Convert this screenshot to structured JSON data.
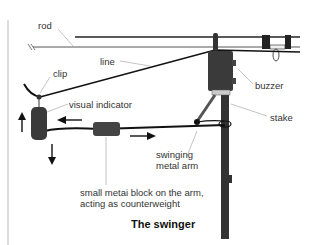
{
  "title": "The swinger",
  "labels": {
    "rod": "rod",
    "line": "line",
    "clip": "clip",
    "visual_indicator": "visual indicator",
    "buzzer": "buzzer",
    "stake": "stake",
    "swinging_arm_1": "swinging",
    "swinging_arm_2": "metal arm",
    "block_1": "small metai block on the arm,",
    "block_2": "acting as counterweight"
  },
  "colors": {
    "ink": "#1a1a1a",
    "leader": "#999999",
    "border": "#bbbbbb"
  }
}
